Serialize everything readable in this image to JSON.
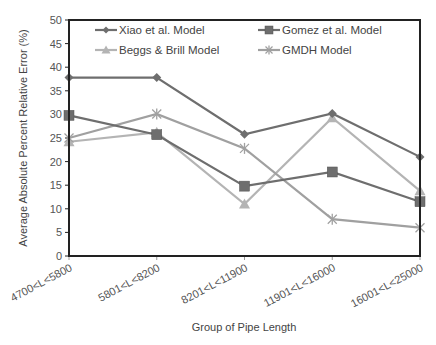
{
  "chart_data": {
    "type": "line",
    "title": "",
    "xlabel": "Group of Pipe Length",
    "ylabel": "Average Absolute Percent Relative Error (%)",
    "ylim": [
      0,
      50
    ],
    "yticks": [
      0,
      5,
      10,
      15,
      20,
      25,
      30,
      35,
      40,
      45,
      50
    ],
    "grid": false,
    "legend_position": "top-inside",
    "categories": [
      "4700<L<5800",
      "5801<L<8200",
      "8201<L<11900",
      "11901<L<16000",
      "16001<L<25000"
    ],
    "series": [
      {
        "name": "Xiao et al. Model",
        "marker": "diamond",
        "color": "#6e6e6e",
        "values": [
          37.8,
          37.8,
          25.8,
          30.2,
          21.0
        ]
      },
      {
        "name": "Gomez et al. Model",
        "marker": "square",
        "color": "#6e6e6e",
        "values": [
          29.8,
          25.7,
          14.8,
          17.8,
          11.5
        ]
      },
      {
        "name": "Beggs & Brill Model",
        "marker": "triangle",
        "color": "#b4b4b4",
        "values": [
          24.2,
          26.2,
          11.0,
          29.3,
          13.8
        ]
      },
      {
        "name": "GMDH Model",
        "marker": "star",
        "color": "#a0a0a0",
        "values": [
          25.0,
          30.1,
          22.8,
          7.8,
          6.0
        ]
      }
    ]
  }
}
